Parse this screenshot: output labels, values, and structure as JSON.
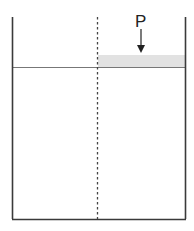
{
  "diagram": {
    "load_label": "P",
    "colors": {
      "wall": "#3a3a3a",
      "surface_line": "#777777",
      "dashed_line": "#444444",
      "shaded_region": "#e2e2e2",
      "arrow": "#222222"
    }
  }
}
